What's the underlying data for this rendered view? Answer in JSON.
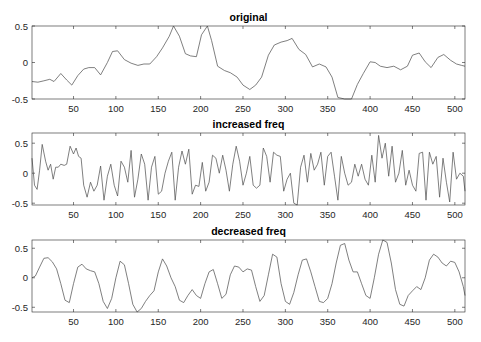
{
  "figure": {
    "width": 481,
    "height": 342,
    "line_color": "#555555",
    "axis_color": "#262626"
  },
  "chart_data": [
    {
      "type": "line",
      "title": "original",
      "xlabel": "",
      "ylabel": "",
      "xlim": [
        1,
        512
      ],
      "ylim": [
        -0.5,
        0.5
      ],
      "xticks": [
        50,
        100,
        150,
        200,
        250,
        300,
        350,
        400,
        450,
        500
      ],
      "yticks": [
        -0.5,
        0,
        0.5
      ],
      "ytick_labels": [
        "-0.5",
        "0",
        "0.5"
      ],
      "grid": false,
      "box": {
        "left": 32,
        "top": 26,
        "right": 465,
        "bottom": 99
      },
      "x": [
        1,
        8,
        15,
        22,
        27,
        35,
        42,
        48,
        55,
        62,
        68,
        75,
        82,
        90,
        96,
        102,
        110,
        118,
        126,
        133,
        140,
        148,
        155,
        163,
        168,
        175,
        182,
        188,
        195,
        201,
        208,
        213,
        220,
        228,
        235,
        243,
        250,
        258,
        265,
        272,
        280,
        287,
        295,
        302,
        308,
        316,
        324,
        332,
        340,
        348,
        355,
        362,
        370,
        378,
        385,
        392,
        400,
        406,
        412,
        420,
        428,
        436,
        444,
        450,
        458,
        465,
        472,
        480,
        487,
        495,
        502,
        508,
        512
      ],
      "values": [
        -0.26,
        -0.27,
        -0.25,
        -0.23,
        -0.26,
        -0.15,
        -0.24,
        -0.31,
        -0.18,
        -0.09,
        -0.07,
        -0.07,
        -0.17,
        0.0,
        0.15,
        0.16,
        0.04,
        -0.01,
        -0.04,
        -0.02,
        -0.02,
        0.08,
        0.2,
        0.36,
        0.5,
        0.36,
        0.12,
        0.09,
        0.08,
        0.38,
        0.5,
        0.3,
        -0.05,
        -0.11,
        -0.14,
        -0.2,
        -0.31,
        -0.37,
        -0.31,
        -0.2,
        0.1,
        0.24,
        0.28,
        0.3,
        0.33,
        0.18,
        0.11,
        -0.06,
        -0.02,
        -0.06,
        -0.2,
        -0.48,
        -0.5,
        -0.5,
        -0.3,
        -0.15,
        0.01,
        0.0,
        -0.05,
        -0.07,
        -0.05,
        -0.1,
        -0.05,
        0.1,
        0.13,
        0.01,
        -0.07,
        0.07,
        0.11,
        0.03,
        -0.02,
        -0.04,
        -0.05
      ]
    },
    {
      "type": "line",
      "title": "increased freq",
      "xlabel": "",
      "ylabel": "",
      "xlim": [
        1,
        512
      ],
      "ylim": [
        -0.53,
        0.67
      ],
      "xticks": [
        50,
        100,
        150,
        200,
        250,
        300,
        350,
        400,
        450,
        500
      ],
      "yticks": [
        -0.5,
        0,
        0.5
      ],
      "ytick_labels": [
        "-0.5",
        "0",
        "0.5"
      ],
      "grid": false,
      "box": {
        "left": 32,
        "top": 133,
        "right": 465,
        "bottom": 205
      },
      "x": [
        1,
        4,
        7,
        10,
        13,
        17,
        20,
        23,
        26,
        29,
        32,
        35,
        39,
        42,
        46,
        50,
        53,
        56,
        59,
        62,
        66,
        70,
        74,
        78,
        82,
        86,
        90,
        94,
        98,
        102,
        106,
        110,
        114,
        118,
        122,
        126,
        130,
        134,
        138,
        142,
        146,
        150,
        154,
        158,
        162,
        166,
        170,
        174,
        178,
        182,
        186,
        190,
        194,
        198,
        202,
        206,
        210,
        214,
        218,
        222,
        226,
        230,
        234,
        238,
        242,
        246,
        250,
        254,
        258,
        262,
        266,
        270,
        274,
        278,
        282,
        286,
        290,
        294,
        298,
        302,
        306,
        310,
        314,
        318,
        322,
        326,
        330,
        334,
        338,
        342,
        346,
        350,
        354,
        358,
        362,
        366,
        370,
        374,
        378,
        382,
        386,
        390,
        394,
        398,
        402,
        406,
        410,
        414,
        418,
        422,
        426,
        430,
        434,
        438,
        442,
        446,
        450,
        454,
        458,
        462,
        466,
        470,
        474,
        478,
        482,
        486,
        490,
        494,
        498,
        502,
        506,
        510,
        512
      ],
      "values": [
        0.25,
        -0.2,
        -0.27,
        0.05,
        0.48,
        0.2,
        0.05,
        0.15,
        -0.1,
        0.1,
        0.1,
        0.15,
        0.13,
        0.15,
        0.45,
        0.32,
        0.42,
        0.28,
        0.25,
        -0.2,
        -0.4,
        -0.15,
        -0.3,
        -0.2,
        0.12,
        -0.45,
        -0.05,
        0.15,
        -0.2,
        -0.38,
        0.2,
        0.1,
        -0.15,
        0.38,
        -0.4,
        -0.1,
        0.32,
        0.15,
        -0.45,
        0.1,
        0.28,
        -0.35,
        -0.3,
        0.0,
        0.2,
        0.35,
        -0.45,
        0.1,
        0.37,
        0.15,
        0.4,
        -0.35,
        -0.2,
        -0.22,
        0.18,
        -0.3,
        -0.15,
        0.3,
        0.25,
        0.0,
        0.3,
        0.05,
        -0.3,
        0.15,
        0.45,
        0.2,
        -0.2,
        0.0,
        0.28,
        -0.2,
        -0.25,
        -0.2,
        0.42,
        0.28,
        -0.15,
        0.35,
        0.3,
        0.28,
        -0.3,
        -0.1,
        0.0,
        -0.5,
        -0.53,
        0.1,
        0.3,
        -0.15,
        0.33,
        0.05,
        0.15,
        0.35,
        -0.2,
        0.28,
        0.35,
        -0.05,
        -0.45,
        0.28,
        0.0,
        -0.2,
        -0.15,
        0.15,
        -0.05,
        0.15,
        -0.1,
        -0.2,
        0.3,
        -0.15,
        0.63,
        0.25,
        0.5,
        -0.05,
        0.45,
        -0.15,
        0.0,
        0.38,
        -0.2,
        0.05,
        -0.2,
        -0.3,
        0.33,
        0.35,
        -0.45,
        0.35,
        0.15,
        0.28,
        -0.4,
        0.25,
        -0.15,
        -0.48,
        0.35,
        -0.1,
        0.0,
        -0.05,
        -0.3
      ]
    },
    {
      "type": "line",
      "title": "decreased freq",
      "xlabel": "",
      "ylabel": "",
      "xlim": [
        1,
        512
      ],
      "ylim": [
        -0.58,
        0.64
      ],
      "xticks": [
        50,
        100,
        150,
        200,
        250,
        300,
        350,
        400,
        450,
        500
      ],
      "yticks": [
        -0.5,
        0,
        0.5
      ],
      "ytick_labels": [
        "-0.5",
        "0",
        "0.5"
      ],
      "grid": false,
      "box": {
        "left": 32,
        "top": 240,
        "right": 465,
        "bottom": 312
      },
      "x": [
        1,
        5,
        10,
        15,
        20,
        25,
        30,
        35,
        40,
        45,
        50,
        55,
        60,
        65,
        70,
        75,
        80,
        85,
        90,
        95,
        100,
        105,
        110,
        115,
        120,
        125,
        130,
        135,
        140,
        145,
        150,
        155,
        160,
        165,
        170,
        175,
        180,
        185,
        190,
        195,
        200,
        205,
        210,
        215,
        220,
        225,
        230,
        235,
        240,
        245,
        250,
        255,
        260,
        265,
        270,
        275,
        280,
        285,
        290,
        295,
        300,
        305,
        310,
        315,
        320,
        325,
        330,
        335,
        340,
        345,
        350,
        355,
        360,
        365,
        370,
        375,
        380,
        385,
        390,
        395,
        400,
        405,
        410,
        415,
        420,
        425,
        430,
        435,
        440,
        445,
        450,
        455,
        460,
        465,
        470,
        475,
        480,
        485,
        490,
        495,
        500,
        505,
        510,
        512
      ],
      "values": [
        0.0,
        0.03,
        0.18,
        0.33,
        0.34,
        0.27,
        0.15,
        -0.1,
        -0.38,
        -0.42,
        -0.1,
        0.18,
        0.23,
        0.15,
        0.12,
        0.1,
        -0.1,
        -0.4,
        -0.52,
        -0.35,
        0.0,
        0.28,
        0.22,
        -0.1,
        -0.45,
        -0.58,
        -0.52,
        -0.4,
        -0.3,
        -0.22,
        0.1,
        0.32,
        0.2,
        0.0,
        -0.15,
        -0.38,
        -0.42,
        -0.3,
        -0.2,
        -0.3,
        -0.35,
        -0.1,
        0.1,
        0.14,
        -0.1,
        -0.35,
        -0.28,
        0.05,
        0.2,
        0.18,
        0.1,
        0.15,
        0.13,
        -0.15,
        -0.4,
        -0.3,
        0.05,
        0.4,
        0.35,
        -0.1,
        -0.4,
        -0.45,
        -0.25,
        0.05,
        0.3,
        0.32,
        0.1,
        -0.15,
        -0.4,
        -0.42,
        -0.35,
        -0.1,
        0.25,
        0.55,
        0.58,
        0.3,
        0.1,
        0.1,
        -0.1,
        -0.3,
        -0.35,
        0.0,
        0.4,
        0.64,
        0.6,
        0.25,
        -0.2,
        -0.45,
        -0.48,
        -0.3,
        -0.22,
        -0.15,
        -0.2,
        0.0,
        0.3,
        0.4,
        0.35,
        0.25,
        0.2,
        0.28,
        0.26,
        0.1,
        -0.15,
        -0.3
      ]
    }
  ]
}
